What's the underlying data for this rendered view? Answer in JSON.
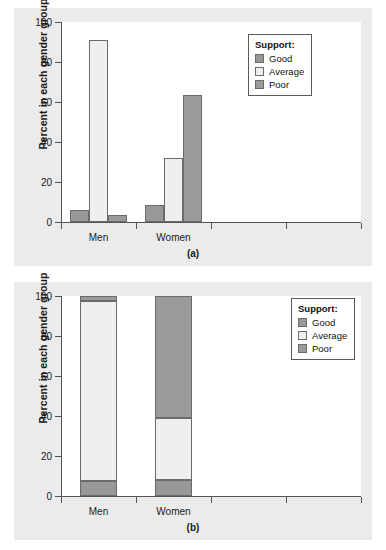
{
  "figure": {
    "panels": [
      {
        "caption": "(a)"
      },
      {
        "caption": "(b)"
      }
    ]
  },
  "legend": {
    "title": "Support:",
    "entries": [
      {
        "label": "Good",
        "color": "#989898"
      },
      {
        "label": "Average",
        "color": "#efefef"
      },
      {
        "label": "Poor",
        "color": "#9a9a9a"
      }
    ]
  },
  "axis": {
    "ylabel": "Percent in each gender group",
    "yticks": [
      "0",
      "20",
      "40",
      "60",
      "80",
      "100"
    ],
    "categories": [
      "Men",
      "Women"
    ]
  },
  "chart_data": [
    {
      "type": "bar",
      "title": "(a)",
      "subtitle": "",
      "xlabel": "",
      "ylabel": "Percent in each gender group",
      "categories": [
        "Men",
        "Women"
      ],
      "series": [
        {
          "name": "Good",
          "values": [
            6,
            8.5
          ],
          "color": "#989898"
        },
        {
          "name": "Average",
          "values": [
            91,
            32
          ],
          "color": "#efefef"
        },
        {
          "name": "Poor",
          "values": [
            3.5,
            63.5
          ],
          "color": "#9a9a9a"
        }
      ],
      "ylim": [
        0,
        100
      ],
      "ytick_values": [
        0,
        20,
        40,
        60,
        80,
        100
      ],
      "grid": false,
      "legend_title": "Support:",
      "legend_position": "top-right",
      "grouping": "grouped"
    },
    {
      "type": "bar",
      "title": "(b)",
      "subtitle": "",
      "xlabel": "",
      "ylabel": "Percent in each gender group",
      "categories": [
        "Men",
        "Women"
      ],
      "series": [
        {
          "name": "Good",
          "values": [
            7.5,
            8
          ],
          "color": "#989898"
        },
        {
          "name": "Average",
          "values": [
            90,
            31
          ],
          "color": "#efefef"
        },
        {
          "name": "Poor",
          "values": [
            2.5,
            61
          ],
          "color": "#9a9a9a"
        }
      ],
      "ylim": [
        0,
        100
      ],
      "ytick_values": [
        0,
        20,
        40,
        60,
        80,
        100
      ],
      "grid": false,
      "legend_title": "Support:",
      "legend_position": "top-right",
      "grouping": "stacked"
    }
  ]
}
